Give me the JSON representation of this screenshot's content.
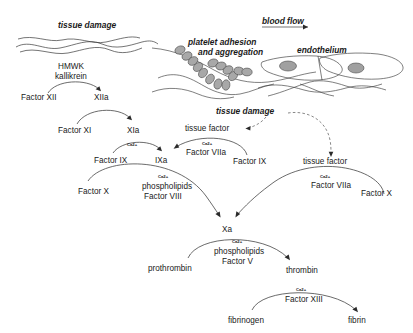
{
  "diagram": {
    "background_color": "#ffffff",
    "line_color": "#3a3a3a",
    "platelet_color": "#a8a8a8",
    "text_color": "#1a1a1a"
  },
  "annotations": {
    "tissue_damage_left": "tissue damage",
    "blood_flow": "blood flow",
    "platelet_adhesion_line1": "platelet adhesion",
    "platelet_adhesion_line2": "and aggregation",
    "endothelium": "endothelium",
    "tissue_damage_mid": "tissue damage"
  },
  "cofactors": {
    "hmwk": "HMWK",
    "kallikrein": "kallikrein",
    "ca_label": "Ca2+",
    "phospholipids": "phospholipids",
    "factor_viii": "Factor VIII",
    "factor_v": "Factor V",
    "factor_viia_left": "Factor VIIa",
    "factor_viia_right": "Factor VIIa",
    "factor_xiii": "Factor XIII",
    "tissue_factor_left": "tissue factor",
    "tissue_factor_right": "tissue factor"
  },
  "factors": {
    "factor_xii": "Factor XII",
    "xiia": "XIIa",
    "factor_xi": "Factor XI",
    "xia": "XIa",
    "factor_ix_left": "Factor IX",
    "ixa": "IXa",
    "factor_ix_right": "Factor IX",
    "factor_x_left": "Factor X",
    "factor_x_right": "Factor X",
    "xa": "Xa",
    "prothrombin": "prothrombin",
    "thrombin": "thrombin",
    "fibrinogen": "fibrinogen",
    "fibrin": "fibrin"
  }
}
